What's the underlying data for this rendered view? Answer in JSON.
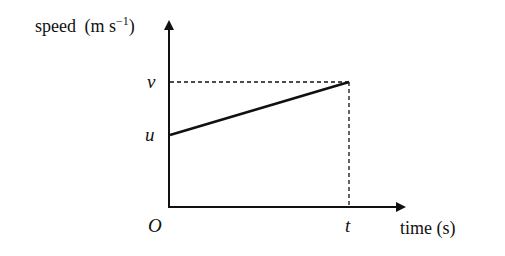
{
  "diagram": {
    "type": "speed-time graph",
    "y_axis": {
      "label": "speed",
      "unit_open": "(m s",
      "unit_sup": "−1",
      "unit_close": ")"
    },
    "x_axis": {
      "label": "time (s)"
    },
    "origin_label": "O",
    "y_marks": [
      {
        "label": "v",
        "meaning": "final speed"
      },
      {
        "label": "u",
        "meaning": "initial speed"
      }
    ],
    "x_marks": [
      {
        "label": "t",
        "meaning": "time elapsed"
      }
    ],
    "line": {
      "from": [
        "0",
        "u"
      ],
      "to": [
        "t",
        "v"
      ],
      "style": "solid thick"
    },
    "guides": {
      "style": "dashed",
      "horizontal_to": "v",
      "vertical_to": "t"
    },
    "colors": {
      "ink": "#111111",
      "background": "#ffffff"
    }
  }
}
